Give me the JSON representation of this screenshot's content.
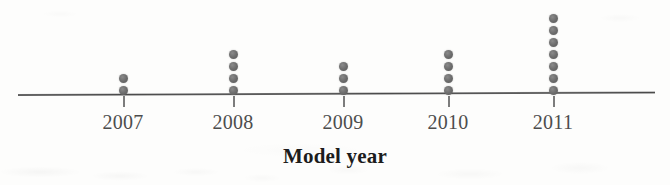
{
  "chart_data": {
    "type": "scatter",
    "plot_kind": "dot-plot",
    "title": "",
    "xlabel": "Model year",
    "ylabel": "",
    "categories": [
      "2007",
      "2008",
      "2009",
      "2010",
      "2011"
    ],
    "values": [
      2,
      4,
      3,
      4,
      7
    ],
    "counts_label": "number of cars",
    "total": 20,
    "series": [
      {
        "name": "Number of cars",
        "values": [
          2,
          4,
          3,
          4,
          7
        ]
      }
    ],
    "ticks": [
      {
        "label": "2007",
        "x": 123,
        "count": 2
      },
      {
        "label": "2008",
        "x": 233,
        "count": 4
      },
      {
        "label": "2009",
        "x": 343,
        "count": 3
      },
      {
        "label": "2010",
        "x": 448,
        "count": 4
      },
      {
        "label": "2011",
        "x": 553,
        "count": 7
      }
    ],
    "grid": false,
    "legend": "none",
    "axis": {
      "line_color": "#4a4a4a",
      "x_start": 18,
      "x_end": 655,
      "y": 94
    },
    "dot": {
      "color": "#6e6e6e",
      "diameter": 9,
      "pitch": 12,
      "baseline_y": 86
    },
    "background_color": "#fdfdfc"
  },
  "figure": {
    "axis_title": "Model year"
  }
}
